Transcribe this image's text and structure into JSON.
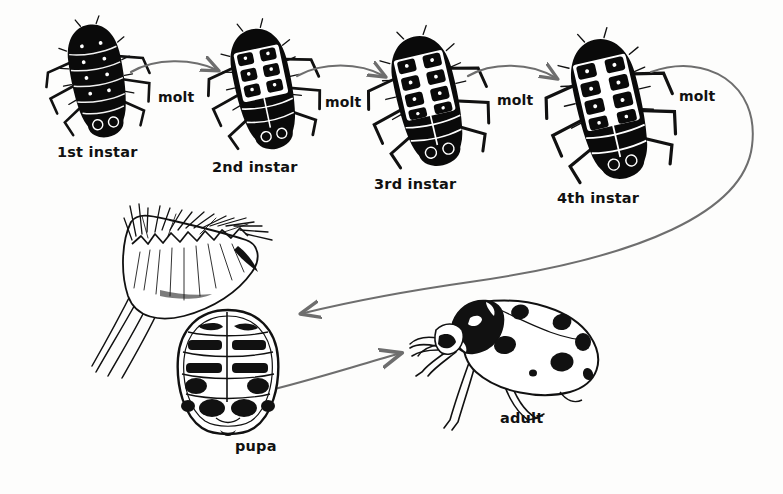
{
  "diagram": {
    "style": "black-and-white pen-and-ink line drawing",
    "background_color": "#fdfdfc",
    "ink_color": "#111111",
    "arrow_color": "#6e6e6e"
  },
  "stages": [
    {
      "id": "instar1",
      "label": "1st instar",
      "label_x": 57,
      "label_y": 145
    },
    {
      "id": "instar2",
      "label": "2nd instar",
      "label_x": 212,
      "label_y": 160
    },
    {
      "id": "instar3",
      "label": "3rd instar",
      "label_x": 374,
      "label_y": 177
    },
    {
      "id": "instar4",
      "label": "4th instar",
      "label_x": 557,
      "label_y": 191
    },
    {
      "id": "pupa",
      "label": "pupa",
      "label_x": 235,
      "label_y": 439
    },
    {
      "id": "adult",
      "label": "adult",
      "label_x": 500,
      "label_y": 411
    }
  ],
  "transitions": [
    {
      "id": "molt1",
      "label": "molt",
      "label_x": 158,
      "label_y": 90,
      "from": "instar1",
      "to": "instar2"
    },
    {
      "id": "molt2",
      "label": "molt",
      "label_x": 325,
      "label_y": 95,
      "from": "instar2",
      "to": "instar3"
    },
    {
      "id": "molt3",
      "label": "molt",
      "label_x": 497,
      "label_y": 93,
      "from": "instar3",
      "to": "instar4"
    },
    {
      "id": "molt4",
      "label": "molt",
      "label_x": 679,
      "label_y": 89,
      "from": "instar4",
      "to": "pupa"
    },
    {
      "id": "emerge",
      "label": "",
      "label_x": 0,
      "label_y": 0,
      "from": "pupa",
      "to": "adult"
    }
  ],
  "adult_detail": {
    "spot_count": 7,
    "spots_visible": 7
  }
}
